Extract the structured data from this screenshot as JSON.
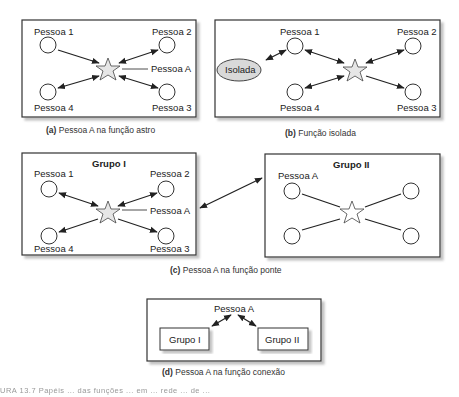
{
  "panels": {
    "a": {
      "caption_letter": "(a)",
      "caption_text": "Pessoa A na função astro",
      "nodes": [
        "Pessoa 1",
        "Pessoa 2",
        "Pessoa 3",
        "Pessoa 4"
      ],
      "center_label": "Pessoa A"
    },
    "b": {
      "caption_letter": "(b)",
      "caption_text": "Função isolada",
      "nodes": [
        "Pessoa 1",
        "Pessoa 2",
        "Pessoa 3",
        "Pessoa 4"
      ],
      "isolated_label": "Isolada"
    },
    "c": {
      "caption_letter": "(c)",
      "caption_text": "Pessoa A na função ponte",
      "group1": {
        "title": "Grupo I",
        "nodes": [
          "Pessoa 1",
          "Pessoa 2",
          "Pessoa 3",
          "Pessoa 4"
        ],
        "center_label": "Pessoa A"
      },
      "group2": {
        "title": "Grupo II",
        "node_label": "Pessoa A"
      }
    },
    "d": {
      "caption_letter": "(d)",
      "caption_text": "Pessoa A na função conexão",
      "top_label": "Pessoa A",
      "left_box": "Grupo I",
      "right_box": "Grupo II"
    }
  },
  "footer_partial": "URA 13.7  Papéis ... das funções ... em ... rede ... de ..."
}
